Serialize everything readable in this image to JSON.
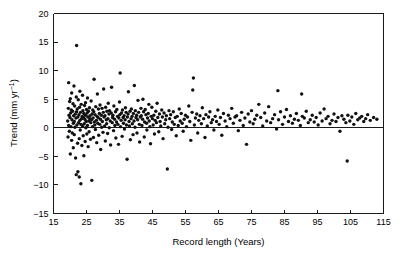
{
  "chart_data": {
    "type": "scatter",
    "title": "",
    "xlabel": "Record length (Years)",
    "ylabel": "Trend (mm yr−1)",
    "ylabel_display": "Trend (mm yr",
    "ylabel_sup": "−1",
    "ylabel_tail": ")",
    "xlim": [
      15,
      115
    ],
    "ylim": [
      -15,
      20
    ],
    "xticks": [
      15,
      25,
      35,
      45,
      55,
      65,
      75,
      85,
      95,
      105,
      115
    ],
    "yticks": [
      20,
      15,
      10,
      5,
      0,
      -5,
      -10,
      -15
    ],
    "xtick_labels": [
      "15",
      "25",
      "35",
      "45",
      "55",
      "65",
      "75",
      "85",
      "95",
      "105",
      "115"
    ],
    "ytick_labels": [
      "20",
      "15",
      "10",
      "5",
      "0",
      "−5",
      "−10",
      "−15"
    ],
    "grid": false,
    "legend": null,
    "reference_lines": [
      {
        "axis": "y",
        "value": 0
      }
    ],
    "marker": {
      "shape": "circle",
      "size": 1.7,
      "color": "#111111"
    },
    "point_count": 392,
    "points": [
      [
        19.3,
        1.2
      ],
      [
        19.4,
        -1.6
      ],
      [
        19.5,
        3.4
      ],
      [
        19.6,
        0.4
      ],
      [
        19.6,
        7.9
      ],
      [
        19.7,
        2.2
      ],
      [
        19.8,
        -0.6
      ],
      [
        19.9,
        4.6
      ],
      [
        20.0,
        1.8
      ],
      [
        20.1,
        5.1
      ],
      [
        20.1,
        -4.6
      ],
      [
        20.2,
        2.6
      ],
      [
        20.3,
        0.2
      ],
      [
        20.4,
        3.1
      ],
      [
        20.5,
        -2.2
      ],
      [
        20.5,
        6.1
      ],
      [
        20.6,
        1.4
      ],
      [
        20.7,
        -0.9
      ],
      [
        20.8,
        2.9
      ],
      [
        20.9,
        4.2
      ],
      [
        21.0,
        0.8
      ],
      [
        21.0,
        -3.5
      ],
      [
        21.1,
        2.1
      ],
      [
        21.2,
        7.3
      ],
      [
        21.3,
        1.1
      ],
      [
        21.3,
        -1.2
      ],
      [
        21.4,
        3.8
      ],
      [
        21.5,
        0.1
      ],
      [
        21.6,
        2.4
      ],
      [
        21.7,
        -5.3
      ],
      [
        21.8,
        1.7
      ],
      [
        21.9,
        5.4
      ],
      [
        21.9,
        -8.2
      ],
      [
        22.0,
        2.8
      ],
      [
        22.0,
        14.4
      ],
      [
        22.1,
        0.5
      ],
      [
        22.2,
        3.3
      ],
      [
        22.3,
        -2.7
      ],
      [
        22.4,
        1.9
      ],
      [
        22.4,
        -7.7
      ],
      [
        22.5,
        4.9
      ],
      [
        22.6,
        0.9
      ],
      [
        22.7,
        2.3
      ],
      [
        22.8,
        -1.9
      ],
      [
        22.8,
        -8.6
      ],
      [
        22.9,
        3.6
      ],
      [
        23.0,
        1.3
      ],
      [
        23.0,
        6.4
      ],
      [
        23.1,
        -0.4
      ],
      [
        23.2,
        2.7
      ],
      [
        23.3,
        0.6
      ],
      [
        23.3,
        -9.8
      ],
      [
        23.4,
        4.1
      ],
      [
        23.5,
        1.6
      ],
      [
        23.6,
        -3.1
      ],
      [
        23.7,
        2.0
      ],
      [
        23.8,
        5.7
      ],
      [
        23.8,
        0.3
      ],
      [
        23.9,
        3.0
      ],
      [
        24.0,
        -1.4
      ],
      [
        24.1,
        1.8
      ],
      [
        24.2,
        2.5
      ],
      [
        24.2,
        -4.9
      ],
      [
        24.3,
        0.7
      ],
      [
        24.4,
        3.9
      ],
      [
        24.5,
        1.5
      ],
      [
        24.6,
        -2.4
      ],
      [
        24.7,
        2.2
      ],
      [
        24.7,
        4.4
      ],
      [
        24.8,
        0.0
      ],
      [
        24.9,
        1.1
      ],
      [
        25.0,
        3.2
      ],
      [
        25.1,
        -1.1
      ],
      [
        25.2,
        2.6
      ],
      [
        25.3,
        0.4
      ],
      [
        25.3,
        5.2
      ],
      [
        25.4,
        1.9
      ],
      [
        25.5,
        -3.3
      ],
      [
        25.6,
        2.9
      ],
      [
        25.7,
        1.2
      ],
      [
        25.8,
        -0.7
      ],
      [
        25.9,
        3.5
      ],
      [
        26.0,
        1.6
      ],
      [
        26.1,
        2.1
      ],
      [
        26.2,
        -2.0
      ],
      [
        26.3,
        0.9
      ],
      [
        26.4,
        4.7
      ],
      [
        26.5,
        1.4
      ],
      [
        26.6,
        -9.2
      ],
      [
        26.7,
        2.4
      ],
      [
        26.8,
        0.2
      ],
      [
        26.9,
        3.1
      ],
      [
        27.0,
        1.7
      ],
      [
        27.1,
        -1.7
      ],
      [
        27.2,
        2.8
      ],
      [
        27.3,
        8.5
      ],
      [
        27.4,
        1.0
      ],
      [
        27.5,
        0.5
      ],
      [
        27.6,
        2.3
      ],
      [
        27.7,
        -0.3
      ],
      [
        27.8,
        3.7
      ],
      [
        28.0,
        1.3
      ],
      [
        28.1,
        -2.6
      ],
      [
        28.2,
        2.0
      ],
      [
        28.3,
        5.9
      ],
      [
        28.4,
        0.8
      ],
      [
        28.5,
        1.8
      ],
      [
        28.6,
        3.3
      ],
      [
        28.7,
        -1.3
      ],
      [
        28.9,
        2.5
      ],
      [
        29.0,
        0.6
      ],
      [
        29.1,
        4.0
      ],
      [
        29.2,
        1.5
      ],
      [
        29.3,
        -3.8
      ],
      [
        29.5,
        2.2
      ],
      [
        29.6,
        0.1
      ],
      [
        29.7,
        3.4
      ],
      [
        29.8,
        1.1
      ],
      [
        30.0,
        -0.8
      ],
      [
        30.1,
        2.7
      ],
      [
        30.2,
        6.8
      ],
      [
        30.3,
        1.9
      ],
      [
        30.5,
        0.3
      ],
      [
        30.6,
        2.1
      ],
      [
        30.7,
        -2.3
      ],
      [
        30.8,
        3.6
      ],
      [
        31.0,
        1.4
      ],
      [
        31.1,
        0.7
      ],
      [
        31.2,
        2.9
      ],
      [
        31.4,
        -1.0
      ],
      [
        31.5,
        1.6
      ],
      [
        31.6,
        4.3
      ],
      [
        31.8,
        2.4
      ],
      [
        31.9,
        0.0
      ],
      [
        32.0,
        3.0
      ],
      [
        32.2,
        1.2
      ],
      [
        32.3,
        -3.0
      ],
      [
        32.5,
        2.6
      ],
      [
        32.6,
        7.1
      ],
      [
        32.8,
        0.9
      ],
      [
        32.9,
        1.8
      ],
      [
        33.0,
        2.2
      ],
      [
        33.2,
        -0.5
      ],
      [
        33.3,
        3.8
      ],
      [
        33.5,
        1.5
      ],
      [
        33.6,
        0.4
      ],
      [
        33.8,
        2.8
      ],
      [
        33.9,
        -1.8
      ],
      [
        34.1,
        1.0
      ],
      [
        34.2,
        3.2
      ],
      [
        34.4,
        2.0
      ],
      [
        34.5,
        0.6
      ],
      [
        34.7,
        -2.9
      ],
      [
        34.8,
        1.7
      ],
      [
        35.0,
        4.5
      ],
      [
        35.1,
        2.3
      ],
      [
        35.2,
        9.6
      ],
      [
        35.3,
        0.2
      ],
      [
        35.5,
        1.3
      ],
      [
        35.6,
        2.6
      ],
      [
        35.8,
        -1.5
      ],
      [
        35.9,
        3.1
      ],
      [
        36.1,
        1.8
      ],
      [
        36.2,
        0.8
      ],
      [
        36.4,
        2.1
      ],
      [
        36.5,
        -0.2
      ],
      [
        36.7,
        1.4
      ],
      [
        36.8,
        3.5
      ],
      [
        37.0,
        2.7
      ],
      [
        37.1,
        0.5
      ],
      [
        37.3,
        -5.5
      ],
      [
        37.4,
        1.9
      ],
      [
        37.6,
        2.4
      ],
      [
        37.7,
        6.3
      ],
      [
        37.9,
        1.1
      ],
      [
        38.0,
        0.3
      ],
      [
        38.2,
        2.9
      ],
      [
        38.3,
        -2.1
      ],
      [
        38.5,
        1.6
      ],
      [
        38.6,
        3.3
      ],
      [
        38.8,
        2.0
      ],
      [
        38.9,
        0.7
      ],
      [
        39.1,
        -1.2
      ],
      [
        39.2,
        2.5
      ],
      [
        39.4,
        1.2
      ],
      [
        39.5,
        7.4
      ],
      [
        39.7,
        0.1
      ],
      [
        39.8,
        3.0
      ],
      [
        40.0,
        1.8
      ],
      [
        40.2,
        2.2
      ],
      [
        40.3,
        -0.9
      ],
      [
        40.5,
        1.4
      ],
      [
        40.6,
        4.8
      ],
      [
        40.8,
        2.7
      ],
      [
        41.0,
        0.6
      ],
      [
        41.1,
        -2.5
      ],
      [
        41.3,
        1.9
      ],
      [
        41.5,
        3.4
      ],
      [
        41.6,
        2.1
      ],
      [
        41.8,
        0.4
      ],
      [
        42.0,
        1.5
      ],
      [
        42.1,
        5.0
      ],
      [
        42.3,
        2.8
      ],
      [
        42.5,
        -1.6
      ],
      [
        42.6,
        1.0
      ],
      [
        42.8,
        3.2
      ],
      [
        43.0,
        2.3
      ],
      [
        43.2,
        0.8
      ],
      [
        43.3,
        -0.4
      ],
      [
        43.5,
        1.7
      ],
      [
        43.7,
        2.5
      ],
      [
        43.9,
        4.1
      ],
      [
        44.0,
        1.2
      ],
      [
        44.2,
        0.2
      ],
      [
        44.4,
        -2.8
      ],
      [
        44.6,
        2.0
      ],
      [
        44.8,
        3.6
      ],
      [
        45.0,
        1.6
      ],
      [
        45.2,
        0.5
      ],
      [
        45.4,
        2.2
      ],
      [
        45.6,
        -1.1
      ],
      [
        45.8,
        1.3
      ],
      [
        46.0,
        2.9
      ],
      [
        46.2,
        0.9
      ],
      [
        46.4,
        4.3
      ],
      [
        46.6,
        1.8
      ],
      [
        46.9,
        -0.7
      ],
      [
        47.1,
        2.4
      ],
      [
        47.3,
        1.1
      ],
      [
        47.5,
        0.3
      ],
      [
        47.8,
        3.1
      ],
      [
        48.0,
        1.9
      ],
      [
        48.2,
        -1.9
      ],
      [
        48.5,
        2.6
      ],
      [
        48.7,
        0.7
      ],
      [
        49.0,
        1.4
      ],
      [
        49.2,
        2.1
      ],
      [
        49.5,
        -7.2
      ],
      [
        49.7,
        0.1
      ],
      [
        50.0,
        3.0
      ],
      [
        50.2,
        1.6
      ],
      [
        50.5,
        2.3
      ],
      [
        50.8,
        -0.3
      ],
      [
        51.0,
        1.0
      ],
      [
        51.3,
        2.8
      ],
      [
        51.6,
        0.6
      ],
      [
        51.9,
        1.8
      ],
      [
        52.2,
        -1.4
      ],
      [
        52.5,
        2.0
      ],
      [
        52.8,
        0.4
      ],
      [
        53.1,
        3.3
      ],
      [
        53.4,
        1.2
      ],
      [
        53.7,
        2.5
      ],
      [
        54.0,
        0.8
      ],
      [
        54.3,
        -0.6
      ],
      [
        54.6,
        1.5
      ],
      [
        55.0,
        2.2
      ],
      [
        55.3,
        0.2
      ],
      [
        55.6,
        1.9
      ],
      [
        56.0,
        3.8
      ],
      [
        56.3,
        1.1
      ],
      [
        56.6,
        -2.2
      ],
      [
        57.0,
        2.7
      ],
      [
        57.2,
        6.6
      ],
      [
        57.4,
        8.7
      ],
      [
        57.7,
        0.5
      ],
      [
        58.0,
        1.7
      ],
      [
        58.4,
        2.4
      ],
      [
        58.7,
        -0.9
      ],
      [
        59.0,
        1.3
      ],
      [
        59.4,
        2.1
      ],
      [
        59.8,
        0.7
      ],
      [
        60.1,
        3.5
      ],
      [
        60.5,
        1.6
      ],
      [
        60.9,
        -1.7
      ],
      [
        61.2,
        2.3
      ],
      [
        61.6,
        0.3
      ],
      [
        62.0,
        1.9
      ],
      [
        62.4,
        2.8
      ],
      [
        62.8,
        0.9
      ],
      [
        63.2,
        1.4
      ],
      [
        63.6,
        -0.4
      ],
      [
        64.0,
        2.0
      ],
      [
        64.4,
        1.1
      ],
      [
        64.8,
        3.1
      ],
      [
        65.2,
        0.6
      ],
      [
        65.6,
        1.8
      ],
      [
        66.0,
        -1.3
      ],
      [
        66.5,
        2.5
      ],
      [
        67.0,
        1.2
      ],
      [
        67.5,
        0.2
      ],
      [
        68.0,
        2.2
      ],
      [
        68.5,
        1.6
      ],
      [
        69.0,
        3.4
      ],
      [
        69.5,
        0.8
      ],
      [
        70.0,
        1.9
      ],
      [
        70.5,
        2.1
      ],
      [
        71.0,
        -0.5
      ],
      [
        71.5,
        1.3
      ],
      [
        72.0,
        2.7
      ],
      [
        72.5,
        0.4
      ],
      [
        73.0,
        1.7
      ],
      [
        73.5,
        -2.9
      ],
      [
        74.0,
        2.4
      ],
      [
        74.5,
        1.0
      ],
      [
        75.0,
        3.0
      ],
      [
        75.5,
        0.7
      ],
      [
        76.0,
        1.5
      ],
      [
        76.6,
        2.2
      ],
      [
        77.2,
        4.1
      ],
      [
        77.8,
        1.8
      ],
      [
        78.4,
        0.3
      ],
      [
        79.0,
        2.6
      ],
      [
        79.6,
        1.2
      ],
      [
        80.2,
        3.7
      ],
      [
        80.8,
        0.9
      ],
      [
        81.4,
        1.6
      ],
      [
        82.0,
        2.3
      ],
      [
        82.6,
        -0.2
      ],
      [
        83.0,
        6.5
      ],
      [
        83.2,
        1.4
      ],
      [
        83.8,
        2.8
      ],
      [
        84.4,
        0.6
      ],
      [
        85.0,
        1.9
      ],
      [
        85.6,
        3.2
      ],
      [
        86.2,
        1.1
      ],
      [
        86.8,
        2.1
      ],
      [
        87.4,
        0.8
      ],
      [
        88.0,
        1.5
      ],
      [
        88.6,
        2.5
      ],
      [
        89.2,
        1.3
      ],
      [
        89.8,
        0.4
      ],
      [
        90.2,
        5.9
      ],
      [
        90.4,
        2.0
      ],
      [
        91.0,
        1.7
      ],
      [
        91.6,
        2.9
      ],
      [
        92.2,
        0.9
      ],
      [
        92.8,
        1.4
      ],
      [
        93.4,
        2.2
      ],
      [
        94.0,
        1.0
      ],
      [
        94.6,
        1.8
      ],
      [
        95.2,
        0.5
      ],
      [
        95.8,
        2.6
      ],
      [
        96.4,
        1.2
      ],
      [
        97.0,
        3.3
      ],
      [
        97.6,
        1.6
      ],
      [
        98.2,
        2.0
      ],
      [
        98.8,
        0.7
      ],
      [
        99.4,
        1.3
      ],
      [
        100.0,
        2.4
      ],
      [
        100.6,
        1.1
      ],
      [
        101.2,
        1.8
      ],
      [
        101.8,
        -0.6
      ],
      [
        102.4,
        2.1
      ],
      [
        103.0,
        1.5
      ],
      [
        103.6,
        0.9
      ],
      [
        104.0,
        -5.8
      ],
      [
        104.2,
        2.2
      ],
      [
        104.8,
        1.2
      ],
      [
        105.4,
        1.9
      ],
      [
        106.0,
        0.6
      ],
      [
        106.6,
        2.5
      ],
      [
        107.2,
        1.4
      ],
      [
        107.8,
        1.7
      ],
      [
        108.4,
        2.0
      ],
      [
        109.0,
        1.1
      ],
      [
        109.6,
        1.6
      ],
      [
        110.2,
        2.3
      ],
      [
        111.0,
        1.3
      ],
      [
        112.0,
        1.8
      ],
      [
        113.0,
        1.5
      ]
    ]
  },
  "axes": {
    "x_title": "Record length (Years)",
    "y_title_main": "Trend (mm yr",
    "y_title_sup": "−1",
    "y_title_end": ")"
  }
}
